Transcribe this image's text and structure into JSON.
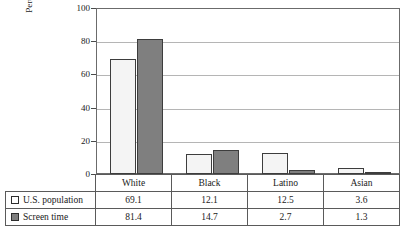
{
  "chart_data": {
    "type": "bar",
    "title": "",
    "xlabel": "",
    "ylabel": "Percentage of Total",
    "ylim": [
      0,
      100
    ],
    "yticks": [
      0,
      20,
      40,
      60,
      80,
      100
    ],
    "grid": true,
    "legend_position": "table-below",
    "categories": [
      "White",
      "Black",
      "Latino",
      "Asian"
    ],
    "series": [
      {
        "name": "U.S. population",
        "swatch_color": "#ffffff",
        "values": [
          69.1,
          12.1,
          12.5,
          3.6
        ]
      },
      {
        "name": "Screen time",
        "swatch_color": "#7f7f7f",
        "values": [
          81.4,
          14.7,
          2.7,
          1.3
        ]
      }
    ]
  },
  "axis": {
    "y_title": "Percentage of Total",
    "y_tick_labels": [
      "100",
      "80",
      "60",
      "40",
      "20",
      "0"
    ]
  },
  "colors": {
    "series_light": "#f4f4f4",
    "series_dark": "#7f7f7f",
    "bar_outline": "#3d3d3d",
    "frame": "#6b6b6b",
    "gridline": "#b5b5b5",
    "table_border": "#5a5a5a"
  }
}
